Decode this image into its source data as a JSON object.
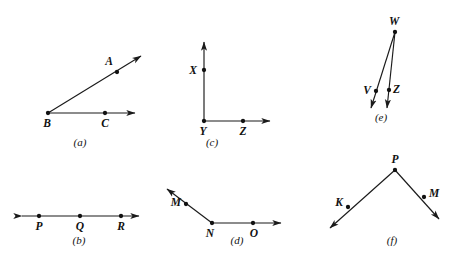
{
  "figure": {
    "background_color": "#ffffff",
    "stroke_color": "#1a1a1a",
    "label_color": "#111111",
    "width": 458,
    "height": 266
  },
  "panels": [
    {
      "id": "a",
      "caption": "(a)",
      "caption_x": 80,
      "caption_y": 146,
      "description": "Angle ABC with vertex B, ray BA and ray BC",
      "strokes": [
        {
          "name": "ray-b-to-a",
          "x1": 48,
          "y1": 113,
          "x2": 141,
          "y2": 56,
          "arrow_end": true,
          "arrow_start": false
        },
        {
          "name": "ray-b-to-c",
          "x1": 48,
          "y1": 113,
          "x2": 135,
          "y2": 113,
          "arrow_end": true,
          "arrow_start": false
        }
      ],
      "points": [
        {
          "name": "point-a",
          "label": "A",
          "x": 117,
          "y": 72,
          "label_dx": -4,
          "label_dy": -7,
          "anchor": "end"
        },
        {
          "name": "point-b",
          "label": "B",
          "x": 48,
          "y": 113,
          "label_dx": -1,
          "label_dy": 14,
          "anchor": "middle"
        },
        {
          "name": "point-c",
          "label": "C",
          "x": 105,
          "y": 113,
          "label_dx": 0,
          "label_dy": 14,
          "anchor": "middle"
        }
      ]
    },
    {
      "id": "b",
      "caption": "(b)",
      "caption_x": 79,
      "caption_y": 244,
      "description": "Line through collinear points P, Q and R with arrows at both ends",
      "strokes": [
        {
          "name": "line-p-q-r",
          "x1": 22,
          "y1": 216,
          "x2": 139,
          "y2": 216,
          "arrow_end": true,
          "arrow_start": true
        }
      ],
      "points": [
        {
          "name": "point-p",
          "label": "P",
          "x": 39,
          "y": 216,
          "label_dx": 0,
          "label_dy": 14,
          "anchor": "middle"
        },
        {
          "name": "point-q",
          "label": "Q",
          "x": 80,
          "y": 216,
          "label_dx": 0,
          "label_dy": 14,
          "anchor": "middle"
        },
        {
          "name": "point-r",
          "label": "R",
          "x": 121,
          "y": 216,
          "label_dx": 0,
          "label_dy": 14,
          "anchor": "middle"
        }
      ]
    },
    {
      "id": "c",
      "caption": "(c)",
      "caption_x": 212,
      "caption_y": 146,
      "description": "Right angle XYZ with vertical ray YX and horizontal ray YZ",
      "strokes": [
        {
          "name": "ray-y-to-x",
          "x1": 204,
          "y1": 121,
          "x2": 204,
          "y2": 42,
          "arrow_end": true,
          "arrow_start": false
        },
        {
          "name": "ray-y-to-z",
          "x1": 204,
          "y1": 121,
          "x2": 270,
          "y2": 121,
          "arrow_end": true,
          "arrow_start": false
        }
      ],
      "points": [
        {
          "name": "point-x",
          "label": "X",
          "x": 204,
          "y": 70,
          "label_dx": -7,
          "label_dy": 4,
          "anchor": "end"
        },
        {
          "name": "point-y",
          "label": "Y",
          "x": 204,
          "y": 121,
          "label_dx": -1,
          "label_dy": 14,
          "anchor": "middle"
        },
        {
          "name": "point-z",
          "label": "Z",
          "x": 243,
          "y": 121,
          "label_dx": 0,
          "label_dy": 14,
          "anchor": "middle"
        }
      ]
    },
    {
      "id": "d",
      "caption": "(d)",
      "caption_x": 237,
      "caption_y": 244,
      "description": "Obtuse angle MNO with vertex N, ray NM up-left and ray NO to the right",
      "strokes": [
        {
          "name": "ray-n-to-m",
          "x1": 212,
          "y1": 223,
          "x2": 167,
          "y2": 189,
          "arrow_end": true,
          "arrow_start": false
        },
        {
          "name": "ray-n-to-o",
          "x1": 212,
          "y1": 223,
          "x2": 281,
          "y2": 223,
          "arrow_end": true,
          "arrow_start": false
        }
      ],
      "points": [
        {
          "name": "point-m",
          "label": "M",
          "x": 186,
          "y": 204,
          "label_dx": -5,
          "label_dy": 2,
          "anchor": "end"
        },
        {
          "name": "point-n",
          "label": "N",
          "x": 212,
          "y": 223,
          "label_dx": -2,
          "label_dy": 14,
          "anchor": "middle"
        },
        {
          "name": "point-o",
          "label": "O",
          "x": 253,
          "y": 223,
          "label_dx": 1,
          "label_dy": 14,
          "anchor": "middle"
        }
      ]
    },
    {
      "id": "e",
      "caption": "(e)",
      "caption_x": 381,
      "caption_y": 121,
      "description": "Narrow angle VWZ with vertex W and two nearly parallel rays down through V and Z",
      "strokes": [
        {
          "name": "ray-w-to-v",
          "x1": 395,
          "y1": 32,
          "x2": 371,
          "y2": 108,
          "arrow_end": true,
          "arrow_start": false
        },
        {
          "name": "ray-w-to-z",
          "x1": 395,
          "y1": 32,
          "x2": 387,
          "y2": 108,
          "arrow_end": true,
          "arrow_start": false
        }
      ],
      "points": [
        {
          "name": "point-w",
          "label": "W",
          "x": 395,
          "y": 32,
          "label_dx": -1,
          "label_dy": -7,
          "anchor": "middle"
        },
        {
          "name": "point-v",
          "label": "V",
          "x": 376,
          "y": 91,
          "label_dx": -5,
          "label_dy": 3,
          "anchor": "end"
        },
        {
          "name": "point-z",
          "label": "Z",
          "x": 389,
          "y": 90,
          "label_dx": 4,
          "label_dy": 3,
          "anchor": "start"
        }
      ]
    },
    {
      "id": "f",
      "caption": "(f)",
      "caption_x": 392,
      "caption_y": 244,
      "description": "Angle KPM with apex P, ray PK down-left and ray PM down-right",
      "strokes": [
        {
          "name": "ray-p-to-k",
          "x1": 395,
          "y1": 170,
          "x2": 330,
          "y2": 228,
          "arrow_end": true,
          "arrow_start": false
        },
        {
          "name": "ray-p-to-m",
          "x1": 395,
          "y1": 170,
          "x2": 439,
          "y2": 219,
          "arrow_end": true,
          "arrow_start": false
        }
      ],
      "points": [
        {
          "name": "point-p",
          "label": "P",
          "x": 395,
          "y": 170,
          "label_dx": 0,
          "label_dy": -7,
          "anchor": "middle"
        },
        {
          "name": "point-k",
          "label": "K",
          "x": 348,
          "y": 207,
          "label_dx": -5,
          "label_dy": -1,
          "anchor": "end"
        },
        {
          "name": "point-m",
          "label": "M",
          "x": 424,
          "y": 197,
          "label_dx": 5,
          "label_dy": 0,
          "anchor": "start"
        }
      ]
    }
  ]
}
